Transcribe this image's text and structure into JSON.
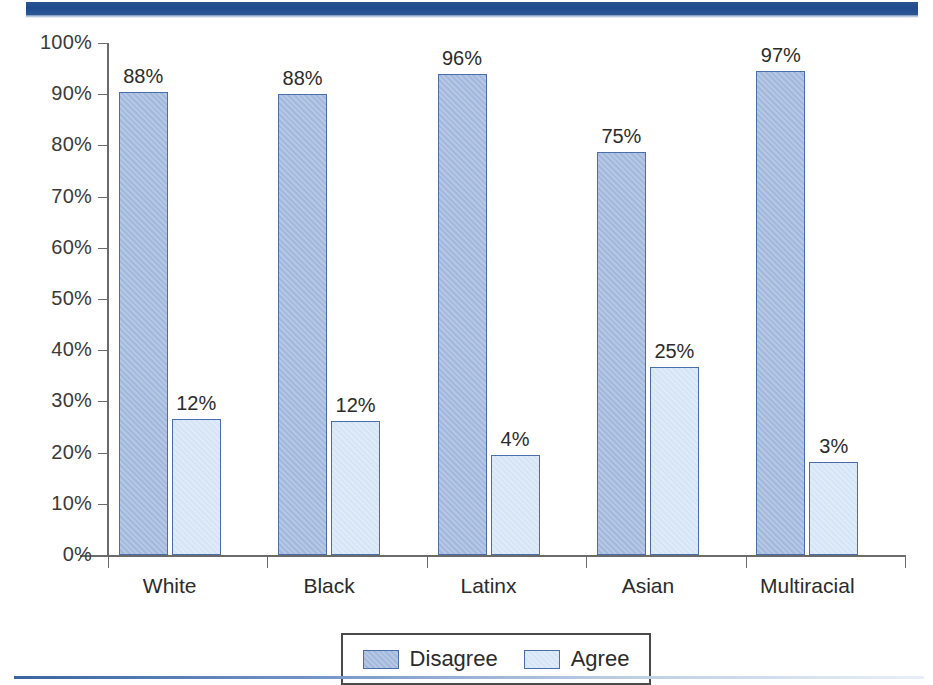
{
  "chart_data": {
    "type": "bar",
    "title": "",
    "xlabel": "",
    "ylabel": "",
    "ylim": [
      0,
      100
    ],
    "grid": false,
    "legend_position": "bottom",
    "value_suffix": "%",
    "categories": [
      "White",
      "Black",
      "Latinx",
      "Asian",
      "Multiracial"
    ],
    "ytick_labels": [
      "0%",
      "10%",
      "20%",
      "30%",
      "40%",
      "50%",
      "60%",
      "70%",
      "80%",
      "90%",
      "100%"
    ],
    "ytick_values": [
      0,
      10,
      20,
      30,
      40,
      50,
      60,
      70,
      80,
      90,
      100
    ],
    "series": [
      {
        "name": "Disagree",
        "color": "#a2b9dd",
        "values": [
          88,
          88,
          96,
          75,
          97
        ],
        "labels": [
          "88%",
          "88%",
          "96%",
          "75%",
          "97%"
        ],
        "drawn_heights": [
          90.4,
          90.0,
          94.0,
          78.7,
          94.5
        ]
      },
      {
        "name": "Agree",
        "color": "#d5e5f6",
        "values": [
          12,
          12,
          4,
          25,
          3
        ],
        "labels": [
          "12%",
          "12%",
          "4%",
          "25%",
          "3%"
        ],
        "drawn_heights": [
          26.5,
          26.2,
          19.5,
          36.7,
          18.2
        ]
      }
    ]
  },
  "legend": {
    "items": [
      {
        "label": "Disagree",
        "swatch": "disagree-swatch"
      },
      {
        "label": "Agree",
        "swatch": "agree-swatch"
      }
    ]
  },
  "decor": {
    "header_band_color": "#1f4b8e",
    "footer_rule_color": "#3c63a0",
    "axis_color": "#6b6b6b",
    "bar_border_color": "#4a6ea9"
  }
}
